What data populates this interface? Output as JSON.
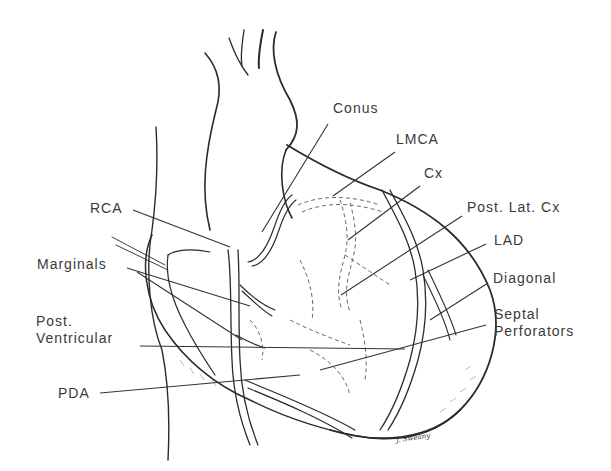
{
  "figure": {
    "signature": "J. Sweany",
    "colors": {
      "ink": "#2b2b2b",
      "label": "#3a3a3a",
      "background": "#ffffff"
    }
  },
  "labels": [
    {
      "id": "conus",
      "text": "Conus",
      "x": 333,
      "y": 100,
      "anchor": [
        328,
        124
      ],
      "target": [
        262,
        232
      ]
    },
    {
      "id": "lmca",
      "text": "LMCA",
      "x": 396,
      "y": 131,
      "anchor": [
        395,
        152
      ],
      "target": [
        333,
        196
      ]
    },
    {
      "id": "cx",
      "text": "Cx",
      "x": 424,
      "y": 165,
      "anchor": [
        420,
        186
      ],
      "target": [
        348,
        240
      ]
    },
    {
      "id": "post-lat-cx",
      "text": "Post. Lat. Cx",
      "x": 467,
      "y": 199,
      "anchor": [
        462,
        216
      ],
      "target": [
        341,
        295
      ]
    },
    {
      "id": "lad",
      "text": "LAD",
      "x": 494,
      "y": 232,
      "anchor": [
        486,
        244
      ],
      "target": [
        410,
        280
      ]
    },
    {
      "id": "diagonal",
      "text": "Diagonal",
      "x": 493,
      "y": 270,
      "anchor": [
        488,
        283
      ],
      "target": [
        430,
        320
      ]
    },
    {
      "id": "septal-perforators",
      "text": "Septal\nPerforators",
      "x": 494,
      "y": 306,
      "anchor": [
        486,
        325
      ],
      "target": [
        395,
        345
      ]
    },
    {
      "id": "rca",
      "text": "RCA",
      "x": 90,
      "y": 200,
      "anchor": [
        133,
        210
      ],
      "target": [
        230,
        247
      ]
    },
    {
      "id": "marginals",
      "text": "Marginals",
      "x": 37,
      "y": 256,
      "anchor": [
        127,
        268
      ],
      "target": [
        250,
        306
      ]
    },
    {
      "id": "post-ventricular",
      "text": "Post.\nVentricular",
      "x": 36,
      "y": 313,
      "anchor": [
        140,
        346
      ],
      "target": [
        405,
        349
      ]
    },
    {
      "id": "pda",
      "text": "PDA",
      "x": 58,
      "y": 385,
      "anchor": [
        100,
        393
      ],
      "target": [
        300,
        375
      ]
    }
  ]
}
